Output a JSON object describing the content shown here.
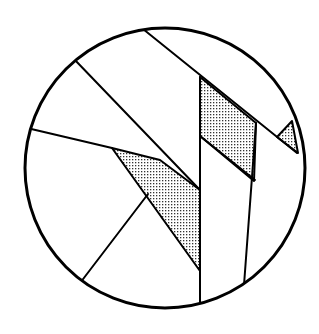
{
  "diagram": {
    "colors": {
      "background": "#ffffff",
      "stroke": "#000000",
      "stipple_dot": "#333333"
    },
    "circle": {
      "cx": 165,
      "cy": 168,
      "r": 140
    },
    "lines": [
      {
        "name": "long-diagonal",
        "x1": 143,
        "y1": 29,
        "x2": 297,
        "y2": 153
      },
      {
        "name": "upper-left-diagonal",
        "x1": 74,
        "y1": 59,
        "x2": 200,
        "y2": 190
      },
      {
        "name": "left-chord",
        "x1": 27,
        "y1": 128,
        "x2": 112,
        "y2": 148
      },
      {
        "name": "lower-left-diagonal",
        "x1": 148,
        "y1": 194,
        "x2": 77,
        "y2": 287
      },
      {
        "name": "center-vertical",
        "x1": 200,
        "y1": 77,
        "x2": 200,
        "y2": 308
      },
      {
        "name": "right-vertical",
        "x1": 256,
        "y1": 123,
        "x2": 244,
        "y2": 285
      },
      {
        "name": "inner-diagonal",
        "x1": 200,
        "y1": 136,
        "x2": 255,
        "y2": 180
      }
    ],
    "stippled_regions": [
      {
        "name": "center-left-stipple",
        "points": "112,148 160,160 200,190 200,271"
      },
      {
        "name": "upper-middle-stipple",
        "points": "200,77 256,123 254,181 200,136"
      },
      {
        "name": "right-triangle-stipple",
        "points": "277,137 292,121 298,153"
      }
    ]
  }
}
